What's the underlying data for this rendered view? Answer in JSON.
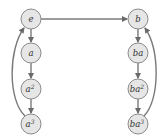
{
  "diagram": {
    "type": "cayley-graph",
    "left_column": {
      "nodes": [
        {
          "id": "e",
          "label": "e",
          "sup": ""
        },
        {
          "id": "a",
          "label": "a",
          "sup": ""
        },
        {
          "id": "a2",
          "label": "a",
          "sup": "2"
        },
        {
          "id": "a3",
          "label": "a",
          "sup": "3"
        }
      ]
    },
    "right_column": {
      "nodes": [
        {
          "id": "b",
          "label": "b",
          "sup": ""
        },
        {
          "id": "ba",
          "label": "ba",
          "sup": ""
        },
        {
          "id": "ba2",
          "label": "ba",
          "sup": "2"
        },
        {
          "id": "ba3",
          "label": "ba",
          "sup": "3"
        }
      ]
    },
    "edges": [
      {
        "from": "e",
        "to": "b"
      },
      {
        "from": "e",
        "to": "a"
      },
      {
        "from": "a",
        "to": "a2"
      },
      {
        "from": "a2",
        "to": "a3"
      },
      {
        "from": "a3",
        "to": "e"
      },
      {
        "from": "b",
        "to": "ba"
      },
      {
        "from": "ba",
        "to": "ba2"
      },
      {
        "from": "ba2",
        "to": "ba3"
      },
      {
        "from": "ba3",
        "to": "b"
      }
    ],
    "colors": {
      "node_fill": "#e6e6e6",
      "node_stroke": "#8a8a8a",
      "edge": "#7a7a7a"
    }
  }
}
